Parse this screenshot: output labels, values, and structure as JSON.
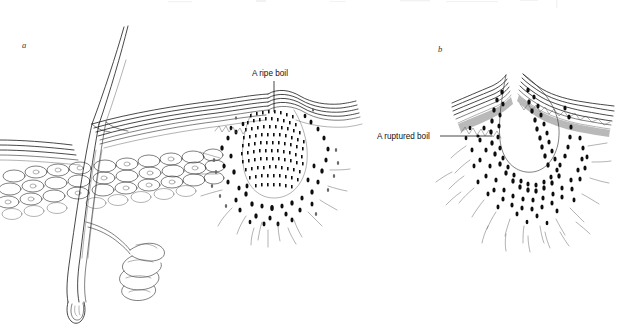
{
  "figure": {
    "background_color": "#ffffff",
    "ink_color": "#1a1a1a",
    "width": 623,
    "height": 332,
    "style": "line drawing with stipple shading"
  },
  "panels": [
    {
      "id": "a",
      "letter": "a",
      "letter_x": 22,
      "letter_y": 48,
      "caption": "A ripe boil",
      "description": "Cross-section of skin with hair shaft, follicle, sweat gland and an intact ripe boil raising the epidermis"
    },
    {
      "id": "b",
      "letter": "b",
      "letter_x": 438,
      "letter_y": 52,
      "caption": "A ruptured boil",
      "description": "Cross-section of skin showing a ruptured boil forming an open crater through the epidermis"
    }
  ],
  "labels": [
    {
      "id": "ripe-boil",
      "text": "A ripe boil",
      "text_x": 252,
      "text_y": 76,
      "anchor": "start",
      "leader": {
        "x1": 274,
        "y1": 81,
        "x2": 274,
        "y2": 112
      }
    },
    {
      "id": "ruptured-boil",
      "text": "A ruptured boil",
      "text_x": 377,
      "text_y": 139,
      "anchor": "start",
      "leader": {
        "x1": 440,
        "y1": 136,
        "x2": 492,
        "y2": 136
      },
      "dot": {
        "cx": 478,
        "cy": 136,
        "r": 1.6
      }
    }
  ],
  "colors": {
    "page_background": "#ffffff",
    "line": "#1a1a1a",
    "fine_line": "#555555",
    "stipple": "#0d0d0d",
    "granular_layer": "#b9b9b9",
    "label_text": "#111111",
    "panel_letter": "#333333"
  },
  "anatomy": {
    "panel_a_features": [
      "hair shaft",
      "epidermis layers",
      "dermis",
      "subcutaneous fat cells",
      "hair follicle",
      "sweat gland coil",
      "hair root bulb",
      "ripe boil core"
    ],
    "panel_b_features": [
      "epidermis layers",
      "granular layer",
      "ruptured crater",
      "inflammatory stipple zone",
      "connective tissue fibres"
    ]
  }
}
